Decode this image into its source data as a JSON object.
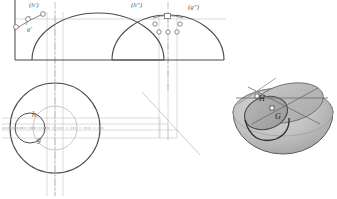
{
  "drawing": {
    "title": "Descriptive geometry: hemisphere with cylindrical cut",
    "background_color": "#ffffff",
    "outline_color": "#4a4a4a",
    "thin_line_color": "#b9b9b9",
    "center_line_color": "#a0a0a0",
    "point_marker_color": "#6e6e6e",
    "label_color": "#5a5a5a",
    "solid_fill_light": "#c9c9c9",
    "solid_fill_mid": "#b0b0b0",
    "solid_fill_dark": "#8f8f8f"
  },
  "views": {
    "front": {
      "name": "front-view",
      "labels": [
        {
          "id": "h-prime",
          "text": "(h')",
          "x": 29,
          "y": 2,
          "size": "lbl-sm"
        },
        {
          "id": "g-prime",
          "text": "g'",
          "x": 27,
          "y": 26,
          "size": "lbl-sm"
        }
      ]
    },
    "side": {
      "name": "side-view",
      "labels": [
        {
          "id": "h-double-prime",
          "text": "(h\")",
          "x": 131,
          "y": 2,
          "size": "lbl-sm"
        },
        {
          "id": "g-double-prime",
          "text": "(g\")",
          "x": 188,
          "y": 4,
          "size": "lbl-sm"
        }
      ]
    },
    "top": {
      "name": "top-view",
      "labels": [
        {
          "id": "h-plain",
          "text": "h",
          "x": 32,
          "y": 111,
          "size": "lbl-md"
        },
        {
          "id": "g-plain",
          "text": "g",
          "x": 37,
          "y": 136,
          "size": "lbl-md"
        }
      ]
    },
    "pictorial": {
      "name": "pictorial-3d-view",
      "labels": [
        {
          "id": "h-3d",
          "text": "H",
          "x": 259,
          "y": 95,
          "size": "lbl-3d"
        },
        {
          "id": "g-3d",
          "text": "G",
          "x": 275,
          "y": 113,
          "size": "lbl-3d"
        }
      ]
    }
  },
  "points": {
    "front": [
      {
        "id": "front-pt-1",
        "cx": 16,
        "cy": 27,
        "r": 2.4
      },
      {
        "id": "front-pt-2",
        "cx": 28,
        "cy": 19,
        "r": 2.4
      },
      {
        "id": "front-pt-3",
        "cx": 43,
        "cy": 14,
        "r": 2.4
      }
    ],
    "side": [
      {
        "id": "side-pt-1",
        "cx": 155,
        "cy": 24,
        "r": 2.2
      },
      {
        "id": "side-pt-2",
        "cx": 180,
        "cy": 24,
        "r": 2.2
      },
      {
        "id": "side-pt-3",
        "cx": 159,
        "cy": 32,
        "r": 2.2
      },
      {
        "id": "side-pt-4",
        "cx": 168,
        "cy": 32,
        "r": 2.2
      },
      {
        "id": "side-pt-5",
        "cx": 177,
        "cy": 32,
        "r": 2.2
      }
    ],
    "side_square": {
      "id": "side-square-marker",
      "x": 165,
      "y": 13,
      "w": 6,
      "h": 5
    }
  },
  "geometry": {
    "front_dome": {
      "cx": 98,
      "cy": 60,
      "rx": 66,
      "ry": 47
    },
    "side_dome": {
      "cx": 168,
      "cy": 60,
      "rx": 56,
      "ry": 45
    },
    "top_outer_circle": {
      "cx": 55,
      "cy": 128,
      "r": 45
    },
    "top_mid_circle": {
      "cx": 55,
      "cy": 128,
      "r": 22
    },
    "top_small_circle": {
      "cx": 30,
      "cy": 128,
      "r": 15
    },
    "sphere_3d": {
      "cx": 283,
      "cy": 122,
      "rx": 50,
      "ry": 42
    }
  }
}
